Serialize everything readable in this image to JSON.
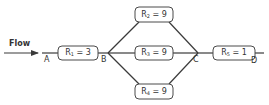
{
  "diagram": {
    "flow_label": "Flow",
    "nodes": {
      "A": "A",
      "B": "B",
      "C": "C",
      "D": "D"
    },
    "resistors": [
      {
        "name": "R",
        "sub": "1",
        "eq": " = 3",
        "value": 3,
        "position": "series-left"
      },
      {
        "name": "R",
        "sub": "2",
        "eq": " = 9",
        "value": 9,
        "position": "parallel-top"
      },
      {
        "name": "R",
        "sub": "3",
        "eq": " = 9",
        "value": 9,
        "position": "parallel-middle"
      },
      {
        "name": "R",
        "sub": "4",
        "eq": " = 9",
        "value": 9,
        "position": "parallel-bottom"
      },
      {
        "name": "R",
        "sub": "5",
        "eq": " = 1",
        "value": 1,
        "position": "series-right"
      }
    ],
    "colors": {
      "line": "#3a3a3a",
      "box_border": "#4a4a4a",
      "text": "#333333",
      "background": "#ffffff"
    }
  }
}
